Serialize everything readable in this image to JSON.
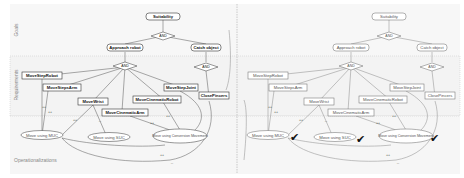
{
  "lanes": {
    "goals": "Goals",
    "requirements": "Requirements",
    "operationalizations": "Operationalizations"
  },
  "left": {
    "goal": "Suitability",
    "and_top": "AND",
    "approach": "Approach robot",
    "catch": "Catch object",
    "and_left": "AND",
    "and_right": "AND",
    "reqs": [
      "MoveStepRobot",
      "MoveStepsArm",
      "MoveWrist",
      "MoveCinematicArm",
      "MoveCinematicRobot",
      "MoveStepJoint",
      "ClosePincers"
    ],
    "ops": [
      "Move using MUC",
      "Move using SUC",
      "Move using Conversion Movement"
    ],
    "contrib": [
      "++",
      "++",
      "++",
      "--",
      "++",
      "++",
      "++",
      "--"
    ]
  },
  "right": {
    "goal": "Suitability",
    "and_top": "AND",
    "approach": "Approach robot",
    "catch": "Catch object",
    "and_left": "AND",
    "and_right": "AND",
    "reqs": [
      "MoveStepRobot",
      "MoveStepsArm",
      "MoveWrist",
      "MoveCinematicArm",
      "MoveCinematicRobot",
      "MoveStepJoint",
      "ClosePincers"
    ],
    "ops": [
      "Move using MUC",
      "Move using SUC",
      "Move using Conversion Movement"
    ],
    "checks": [
      "✔",
      "✔",
      "✔"
    ],
    "contrib": [
      "++",
      "++",
      "++",
      "--",
      "++",
      "++",
      "++",
      "--"
    ]
  }
}
